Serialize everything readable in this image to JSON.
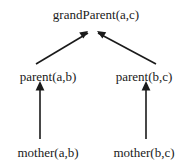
{
  "diagram": {
    "type": "inference-tree",
    "orientation": "bottom-up",
    "stroke_color": "#1a1a1a",
    "background_color": "#ffffff",
    "nodes": [
      {
        "id": "grandparent",
        "label": "grandParent(a,c)",
        "level": 0
      },
      {
        "id": "parent_left",
        "label": "parent(a,b)",
        "level": 1
      },
      {
        "id": "parent_right",
        "label": "parent(b,c)",
        "level": 1
      },
      {
        "id": "mother_left",
        "label": "mother(a,b)",
        "level": 2
      },
      {
        "id": "mother_right",
        "label": "mother(b,c)",
        "level": 2
      }
    ],
    "edges": [
      {
        "from": "parent_left",
        "to": "grandparent",
        "style": "diagonal-arrow"
      },
      {
        "from": "parent_right",
        "to": "grandparent",
        "style": "diagonal-arrow"
      },
      {
        "from": "mother_left",
        "to": "parent_left",
        "style": "vertical-arrow"
      },
      {
        "from": "mother_right",
        "to": "parent_right",
        "style": "vertical-arrow"
      }
    ]
  }
}
